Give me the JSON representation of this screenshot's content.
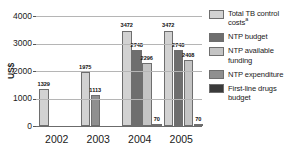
{
  "chart_data": {
    "type": "bar",
    "title": "",
    "subtitle": "",
    "xlabel": "",
    "ylabel": "US$",
    "ylim": [
      0,
      4000
    ],
    "yticks": [
      0,
      1000,
      2000,
      3000,
      4000
    ],
    "ytick_labels": [
      "0",
      "1000",
      "2000",
      "3000",
      "4000"
    ],
    "grid": true,
    "legend_position": "right",
    "categories": [
      "2002",
      "2003",
      "2004",
      "2005"
    ],
    "series": [
      {
        "name": "Total TB control costs",
        "name_superscript": "a",
        "color": "#d2d2d2",
        "values": [
          1329,
          1975,
          3472,
          3472
        ],
        "labels": [
          "1329",
          "1975",
          "3472",
          "3472"
        ]
      },
      {
        "name": "NTP budget",
        "color": "#6e6e6e",
        "values": [
          null,
          null,
          2748,
          2748
        ],
        "labels": [
          "",
          "",
          "2748",
          "2748"
        ]
      },
      {
        "name": "NTP available funding",
        "color": "#c4c4c4",
        "values": [
          null,
          null,
          2296,
          2408
        ],
        "labels": [
          "",
          "",
          "2296",
          "2408"
        ]
      },
      {
        "name": "NTP expenditure",
        "color": "#8f8f8f",
        "values": [
          null,
          1113,
          null,
          null
        ],
        "labels": [
          "",
          "1113",
          "",
          ""
        ]
      },
      {
        "name": "First-line drugs budget",
        "color": "#3a3a3a",
        "values": [
          null,
          null,
          70,
          70
        ],
        "labels": [
          "",
          "",
          "70",
          "70"
        ]
      }
    ]
  },
  "legend": {
    "items": [
      {
        "label": "Total TB control",
        "label_line2": "costs",
        "superscript": "a",
        "color": "#d2d2d2"
      },
      {
        "label": "NTP budget",
        "label_line2": "",
        "superscript": "",
        "color": "#6e6e6e"
      },
      {
        "label": "NTP available",
        "label_line2": "funding",
        "superscript": "",
        "color": "#c4c4c4"
      },
      {
        "label": "NTP expenditure",
        "label_line2": "",
        "superscript": "",
        "color": "#8f8f8f"
      },
      {
        "label": "First-line drugs",
        "label_line2": "budget",
        "superscript": "",
        "color": "#3a3a3a"
      }
    ]
  },
  "axis": {
    "y_title": "US$"
  }
}
